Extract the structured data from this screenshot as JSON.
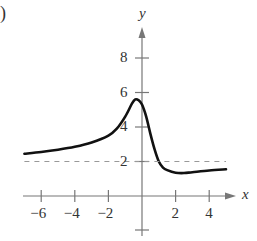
{
  "panel_label": ")",
  "chart_data": {
    "type": "line",
    "title": "",
    "xlabel": "x",
    "ylabel": "y",
    "xlim": [
      -7,
      5.5
    ],
    "ylim": [
      -1.2,
      9.5
    ],
    "x_ticks": [
      -6,
      -4,
      -2,
      2,
      4
    ],
    "y_ticks": [
      2,
      4,
      6,
      8
    ],
    "x_tick_labels": [
      "−6",
      "−4",
      "−2",
      "2",
      "4"
    ],
    "y_tick_labels": [
      "2",
      "4",
      "6",
      "8"
    ],
    "grid": false,
    "series": [
      {
        "name": "f(x)",
        "style": "solid",
        "color": "#111111",
        "x": [
          -7,
          -6,
          -5,
          -4,
          -3,
          -2,
          -1.5,
          -1,
          -0.6,
          -0.4,
          -0.2,
          0,
          0.25,
          0.5,
          0.75,
          1,
          1.25,
          1.5,
          2,
          2.5,
          3,
          4,
          5
        ],
        "y": [
          2.45,
          2.55,
          2.68,
          2.85,
          3.1,
          3.5,
          3.9,
          4.6,
          5.35,
          5.6,
          5.55,
          5.3,
          4.6,
          3.6,
          2.7,
          2.0,
          1.65,
          1.5,
          1.35,
          1.33,
          1.38,
          1.48,
          1.55
        ]
      },
      {
        "name": "asymptote y=2",
        "style": "dashed",
        "color": "#999999",
        "x": [
          -7,
          5
        ],
        "y": [
          2,
          2
        ]
      }
    ]
  }
}
